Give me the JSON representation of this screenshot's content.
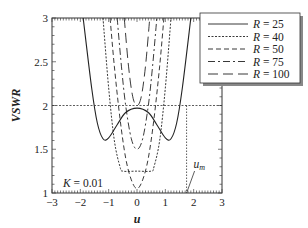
{
  "chart_data": {
    "type": "line",
    "title": "",
    "xlabel": "u",
    "ylabel": "VSWR",
    "xlim": [
      -3,
      3
    ],
    "ylim": [
      1,
      3
    ],
    "xticks": [
      "−3",
      "−2",
      "−1",
      "0",
      "1",
      "2",
      "3"
    ],
    "yticks": [
      "1",
      "1.5",
      "2",
      "2.5",
      "3"
    ],
    "annotations": {
      "param": "K = 0.01",
      "marker_label": "u",
      "marker_sub": "m",
      "reference_vswr": 2,
      "u_m": 1.75
    },
    "legend": {
      "position": "upper right",
      "entries": [
        "R = 25",
        "R = 40",
        "R = 50",
        "R = 75",
        "R = 100"
      ]
    },
    "series": [
      {
        "name": "R = 25",
        "style": "solid",
        "x": [
          -1.9,
          -1.6,
          -1.4,
          -1.2,
          -1.0,
          -0.7,
          -0.4,
          0,
          0.4,
          0.7,
          1.0,
          1.2,
          1.4,
          1.6,
          1.9
        ],
        "y": [
          3.0,
          2.2,
          1.8,
          1.62,
          1.63,
          1.78,
          1.92,
          1.97,
          1.92,
          1.78,
          1.63,
          1.62,
          1.8,
          2.2,
          3.0
        ]
      },
      {
        "name": "R = 40",
        "style": "dotted",
        "x": [
          -1.2,
          -1.0,
          -0.8,
          -0.6,
          -0.5,
          0,
          0.5,
          0.6,
          0.8,
          1.0,
          1.2
        ],
        "y": [
          3.0,
          2.2,
          1.6,
          1.3,
          1.25,
          1.25,
          1.25,
          1.3,
          1.6,
          2.2,
          3.0
        ],
        "min": 1.25
      },
      {
        "name": "R = 50",
        "style": "dashed",
        "x": [
          -0.95,
          -0.8,
          -0.6,
          -0.4,
          -0.2,
          0,
          0.2,
          0.4,
          0.6,
          0.8,
          0.95
        ],
        "y": [
          3.0,
          2.45,
          1.85,
          1.4,
          1.15,
          1.05,
          1.15,
          1.4,
          1.85,
          2.45,
          3.0
        ],
        "min": 1.05
      },
      {
        "name": "R = 75",
        "style": "dash-dot",
        "x": [
          -0.7,
          -0.55,
          -0.4,
          -0.2,
          0,
          0.2,
          0.4,
          0.55,
          0.7
        ],
        "y": [
          3.0,
          2.45,
          2.0,
          1.62,
          1.5,
          1.62,
          2.0,
          2.45,
          3.0
        ],
        "min": 1.5
      },
      {
        "name": "R = 100",
        "style": "long-dash",
        "x": [
          -0.45,
          -0.3,
          -0.15,
          0,
          0.15,
          0.3,
          0.45
        ],
        "y": [
          3.0,
          2.45,
          2.1,
          2.0,
          2.1,
          2.45,
          3.0
        ],
        "min": 2.0
      }
    ],
    "grid": false
  }
}
